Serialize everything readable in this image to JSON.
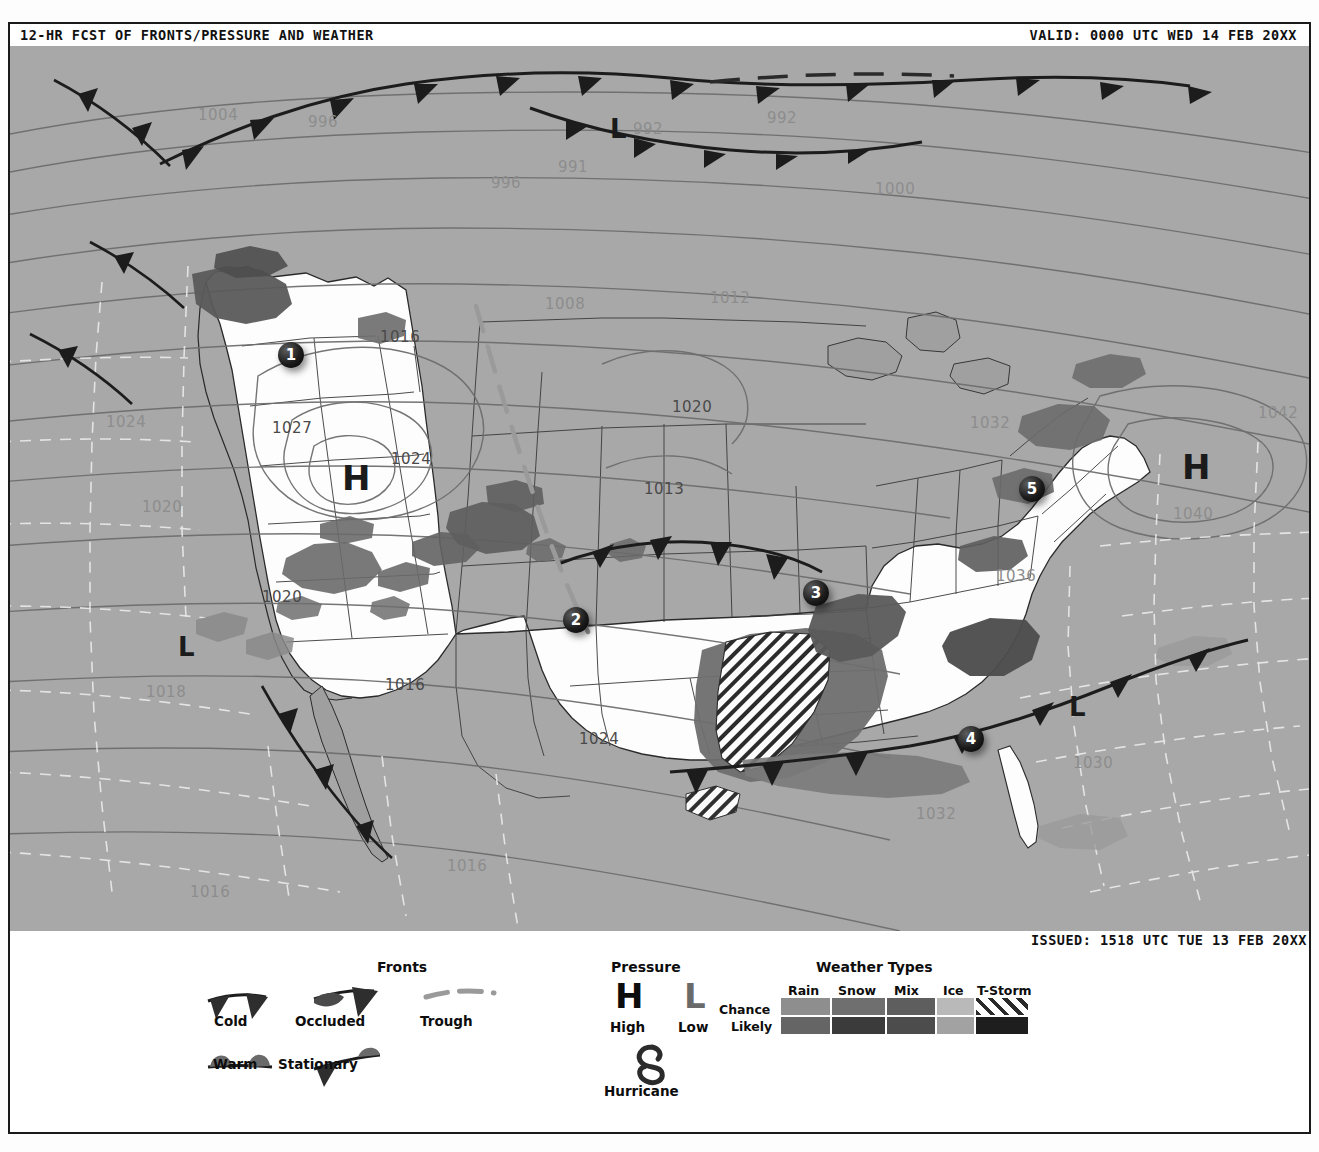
{
  "header": {
    "title": "12-HR FCST OF FRONTS/PRESSURE AND WEATHER",
    "valid": "VALID: 0000 UTC WED 14 FEB 20XX",
    "issued": "ISSUED: 1518 UTC TUE 13 FEB 20XX"
  },
  "map": {
    "watermark": "WED 180214/0000V012  Weather Type SVDPFS",
    "markers": [
      {
        "id": "1",
        "label": "1",
        "x": 268,
        "y": 296
      },
      {
        "id": "2",
        "label": "2",
        "x": 553,
        "y": 561
      },
      {
        "id": "3",
        "label": "3",
        "x": 793,
        "y": 534
      },
      {
        "id": "4",
        "label": "4",
        "x": 948,
        "y": 680
      },
      {
        "id": "5",
        "label": "5",
        "x": 1009,
        "y": 430
      }
    ],
    "pressure_centers": [
      {
        "type": "H",
        "label": "H",
        "x": 332,
        "y": 415,
        "size": 34
      },
      {
        "type": "H",
        "label": "H",
        "x": 1172,
        "y": 404,
        "size": 34
      },
      {
        "type": "L",
        "label": "L",
        "x": 600,
        "y": 70,
        "size": 26
      },
      {
        "type": "L",
        "label": "L",
        "x": 168,
        "y": 588,
        "size": 26
      },
      {
        "type": "L",
        "label": "L",
        "x": 1059,
        "y": 648,
        "size": 26
      }
    ],
    "isobars": [
      {
        "value": "1004",
        "x": 188,
        "y": 60,
        "tone": "light"
      },
      {
        "value": "996",
        "x": 298,
        "y": 67,
        "tone": "light"
      },
      {
        "value": "992",
        "x": 757,
        "y": 63,
        "tone": "light"
      },
      {
        "value": "992",
        "x": 623,
        "y": 74,
        "tone": "light"
      },
      {
        "value": "991",
        "x": 548,
        "y": 112,
        "tone": "light"
      },
      {
        "value": "996",
        "x": 481,
        "y": 128,
        "tone": "light"
      },
      {
        "value": "1000",
        "x": 865,
        "y": 134,
        "tone": "light"
      },
      {
        "value": "1008",
        "x": 535,
        "y": 249,
        "tone": "light"
      },
      {
        "value": "1012",
        "x": 700,
        "y": 243,
        "tone": "light"
      },
      {
        "value": "1024",
        "x": 96,
        "y": 367,
        "tone": "light"
      },
      {
        "value": "1016",
        "x": 370,
        "y": 282,
        "tone": "dark"
      },
      {
        "value": "1027",
        "x": 262,
        "y": 373,
        "tone": "dark"
      },
      {
        "value": "1024",
        "x": 381,
        "y": 404,
        "tone": "dark"
      },
      {
        "value": "1020",
        "x": 662,
        "y": 352,
        "tone": "dark"
      },
      {
        "value": "1013",
        "x": 634,
        "y": 434,
        "tone": "dark"
      },
      {
        "value": "1032",
        "x": 960,
        "y": 368,
        "tone": "light"
      },
      {
        "value": "1042",
        "x": 1248,
        "y": 358,
        "tone": "light"
      },
      {
        "value": "1040",
        "x": 1163,
        "y": 459,
        "tone": "light"
      },
      {
        "value": "1020",
        "x": 132,
        "y": 452,
        "tone": "light"
      },
      {
        "value": "1020",
        "x": 252,
        "y": 542,
        "tone": "dark"
      },
      {
        "value": "1018",
        "x": 136,
        "y": 637,
        "tone": "light"
      },
      {
        "value": "1016",
        "x": 375,
        "y": 630,
        "tone": "dark"
      },
      {
        "value": "1024",
        "x": 569,
        "y": 684,
        "tone": "dark"
      },
      {
        "value": "1036",
        "x": 986,
        "y": 521,
        "tone": "light"
      },
      {
        "value": "1030",
        "x": 1063,
        "y": 708,
        "tone": "light"
      },
      {
        "value": "1032",
        "x": 906,
        "y": 759,
        "tone": "light"
      },
      {
        "value": "1016",
        "x": 437,
        "y": 811,
        "tone": "light"
      },
      {
        "value": "1016",
        "x": 180,
        "y": 837,
        "tone": "light"
      }
    ]
  },
  "legend": {
    "fronts": {
      "title": "Fronts",
      "items": [
        {
          "name": "cold",
          "label": "Cold"
        },
        {
          "name": "occluded",
          "label": "Occluded"
        },
        {
          "name": "trough",
          "label": "Trough"
        },
        {
          "name": "warm",
          "label": "Warm"
        },
        {
          "name": "stationary",
          "label": "Stationary"
        }
      ]
    },
    "pressure": {
      "title": "Pressure",
      "high_glyph": "H",
      "high_label": "High",
      "low_glyph": "L",
      "low_label": "Low",
      "hurricane_label": "Hurricane"
    },
    "weather_types": {
      "title": "Weather Types",
      "columns": [
        "Rain",
        "Snow",
        "Mix",
        "Ice",
        "T-Storm"
      ],
      "rows": [
        "Chance",
        "Likely"
      ],
      "swatches": {
        "chance": [
          "#8e8e8e",
          "#6f6f6f",
          "#5e5e5e",
          "#b9b9b9",
          "hatch"
        ],
        "likely": [
          "#656565",
          "#3b3b3b",
          "#4c4c4c",
          "#a2a2a2",
          "#1e1e1e"
        ]
      }
    }
  },
  "colors": {
    "ocean": "#a8a8a8",
    "land": "#fdfdfd",
    "ink": "#1a1a1a",
    "isobar": "#6e6e6e",
    "precip_light": "#8e8e8e",
    "precip_mid": "#6f6f6f",
    "precip_dark": "#4a4a4a"
  }
}
